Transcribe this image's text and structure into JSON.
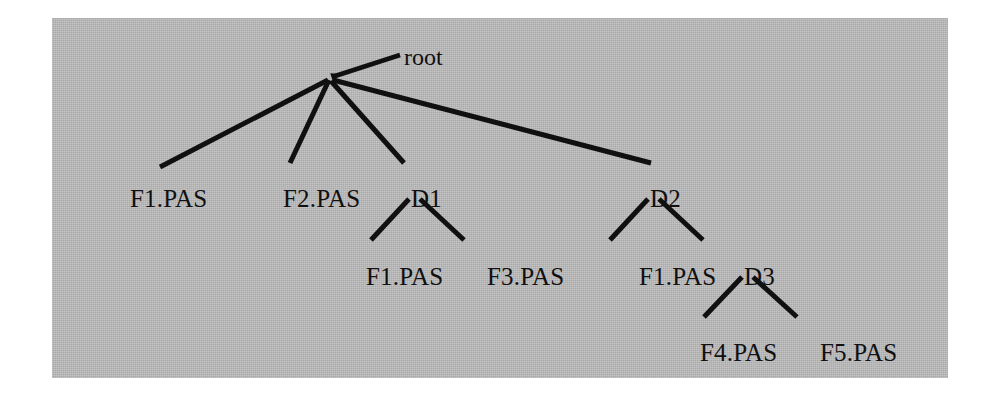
{
  "figure": {
    "background_color": "#ffffff",
    "panel_color": "#b6b6b6",
    "ink_color": "#101010"
  },
  "annotation": {
    "root_pointer_label": "root"
  },
  "tree": {
    "root": {
      "id": "root",
      "label": "",
      "x": 328,
      "y": 79
    },
    "nodes": [
      {
        "id": "f1-level1",
        "label": "F1.PAS",
        "type": "file",
        "x": 130,
        "y": 186,
        "level": 1,
        "parent": "root"
      },
      {
        "id": "f2-level1",
        "label": "F2.PAS",
        "type": "file",
        "x": 283,
        "y": 186,
        "level": 1,
        "parent": "root"
      },
      {
        "id": "d1",
        "label": "D1",
        "type": "directory",
        "x": 411,
        "y": 186,
        "level": 1,
        "parent": "root"
      },
      {
        "id": "d2",
        "label": "D2",
        "type": "directory",
        "x": 650,
        "y": 186,
        "level": 1,
        "parent": "root"
      },
      {
        "id": "f1-under-d1",
        "label": "F1.PAS",
        "type": "file",
        "x": 366,
        "y": 264,
        "level": 2,
        "parent": "d1"
      },
      {
        "id": "f3-under-d1",
        "label": "F3.PAS",
        "type": "file",
        "x": 487,
        "y": 264,
        "level": 2,
        "parent": "d1"
      },
      {
        "id": "f1-under-d2",
        "label": "F1.PAS",
        "type": "file",
        "x": 639,
        "y": 264,
        "level": 2,
        "parent": "d2"
      },
      {
        "id": "d3",
        "label": "D3",
        "type": "directory",
        "x": 744,
        "y": 264,
        "level": 2,
        "parent": "d2"
      },
      {
        "id": "f4-under-d3",
        "label": "F4.PAS",
        "type": "file",
        "x": 700,
        "y": 340,
        "level": 3,
        "parent": "d3"
      },
      {
        "id": "f5-under-d3",
        "label": "F5.PAS",
        "type": "file",
        "x": 820,
        "y": 340,
        "level": 3,
        "parent": "d3"
      }
    ],
    "edges": [
      {
        "id": "edge-root-f1",
        "from": "root",
        "to": "f1-level1",
        "x1": 328,
        "y1": 80,
        "x2": 160,
        "y2": 167
      },
      {
        "id": "edge-root-f2",
        "from": "root",
        "to": "f2-level1",
        "x1": 329,
        "y1": 80,
        "x2": 290,
        "y2": 163
      },
      {
        "id": "edge-root-d1",
        "from": "root",
        "to": "d1",
        "x1": 331,
        "y1": 81,
        "x2": 404,
        "y2": 163
      },
      {
        "id": "edge-root-d2",
        "from": "root",
        "to": "d2",
        "x1": 333,
        "y1": 80,
        "x2": 651,
        "y2": 163
      },
      {
        "id": "edge-d1-f1",
        "from": "d1",
        "to": "f1-under-d1",
        "x1": 409,
        "y1": 199,
        "x2": 371,
        "y2": 240
      },
      {
        "id": "edge-d1-f3",
        "from": "d1",
        "to": "f3-under-d1",
        "x1": 420,
        "y1": 199,
        "x2": 464,
        "y2": 240
      },
      {
        "id": "edge-d2-f1",
        "from": "d2",
        "to": "f1-under-d2",
        "x1": 648,
        "y1": 199,
        "x2": 610,
        "y2": 240
      },
      {
        "id": "edge-d2-d3",
        "from": "d2",
        "to": "d3",
        "x1": 659,
        "y1": 199,
        "x2": 703,
        "y2": 240
      },
      {
        "id": "edge-d3-f4",
        "from": "d3",
        "to": "f4-under-d3",
        "x1": 742,
        "y1": 277,
        "x2": 704,
        "y2": 317
      },
      {
        "id": "edge-d3-f5",
        "from": "d3",
        "to": "f5-under-d3",
        "x1": 753,
        "y1": 277,
        "x2": 797,
        "y2": 317
      }
    ],
    "pointer": {
      "id": "root-pointer-arrow",
      "tail_x": 400,
      "tail_y": 55,
      "head_x": 332,
      "head_y": 77,
      "label_x": 404,
      "label_y": 45
    }
  }
}
